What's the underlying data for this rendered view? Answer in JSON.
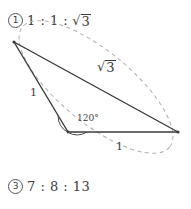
{
  "figure": {
    "title_option": {
      "marker": "1",
      "ratio": "1 : 1 :",
      "radical_sign": "√",
      "radical_body": "3"
    },
    "bottom_option": {
      "marker": "3",
      "ratio": "7 : 8 : 13"
    },
    "labels": {
      "hypotenuse": {
        "radical_sign": "√",
        "radical_body": "3"
      },
      "left_side": "1",
      "bottom_side": "1",
      "angle": "120°"
    },
    "colors": {
      "solid_line": "#3a3a3a",
      "dashed_line": "#b0b0b0",
      "text": "#3b3b3b",
      "background": "#ffffff"
    },
    "geometry": {
      "vertex_top_left": [
        14,
        42
      ],
      "vertex_bottom_mid": [
        68,
        132
      ],
      "vertex_right": [
        178,
        132
      ],
      "triangle_sides": [
        "1",
        "1",
        "√3"
      ],
      "interior_angle_at_bottom_mid": "120°"
    }
  }
}
